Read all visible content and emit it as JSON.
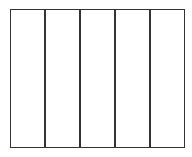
{
  "diagram": {
    "parts": 5,
    "line_color": "#333333",
    "frame": {
      "left": 10,
      "top": 9,
      "right": 185,
      "bottom": 148
    },
    "dividers_x": [
      44,
      79,
      114,
      149
    ]
  }
}
